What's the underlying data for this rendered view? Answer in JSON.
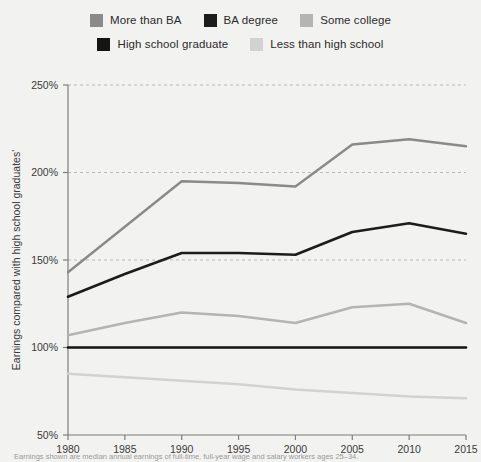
{
  "legend": {
    "rows": [
      [
        {
          "label": "More than BA",
          "color": "#8a8a8a",
          "name": "legend-item-more-than-ba"
        },
        {
          "label": "BA degree",
          "color": "#1c1c1c",
          "name": "legend-item-ba-degree"
        },
        {
          "label": "Some college",
          "color": "#b4b4b4",
          "name": "legend-item-some-college"
        }
      ],
      [
        {
          "label": "High school graduate",
          "color": "#141414",
          "name": "legend-item-high-school-graduate"
        },
        {
          "label": "Less than high school",
          "color": "#d2d2d2",
          "name": "legend-item-less-than-high-school"
        }
      ]
    ]
  },
  "footnote": {
    "text": "Earnings shown are median annual earnings of full-time, full-year wage and salary workers ages 25–34."
  },
  "chart_data": {
    "type": "line",
    "title": "",
    "xlabel": "",
    "ylabel": "Earnings compared with high school graduates'",
    "x": [
      1980,
      1985,
      1990,
      1995,
      2000,
      2005,
      2010,
      2015
    ],
    "xtick_labels": [
      "1980",
      "1985",
      "1990",
      "1995",
      "2000",
      "2005",
      "2010",
      "2015"
    ],
    "xlim": [
      1980,
      2015
    ],
    "ylim": [
      50,
      250
    ],
    "yticks": [
      50,
      100,
      150,
      200,
      250
    ],
    "ytick_labels": [
      "50%",
      "100%",
      "150%",
      "200%",
      "250%"
    ],
    "grid": "horizontal-dashed",
    "legend_position": "top",
    "series": [
      {
        "name": "More than BA",
        "color": "#8a8a8a",
        "width": 2.4,
        "values": [
          143,
          169,
          195,
          194,
          192,
          216,
          219,
          215
        ]
      },
      {
        "name": "BA degree",
        "color": "#1c1c1c",
        "width": 2.6,
        "values": [
          129,
          142,
          154,
          154,
          153,
          166,
          171,
          165
        ]
      },
      {
        "name": "Some college",
        "color": "#b4b4b4",
        "width": 2.6,
        "values": [
          107,
          114,
          120,
          118,
          114,
          123,
          125,
          114
        ]
      },
      {
        "name": "High school graduate",
        "color": "#141414",
        "width": 2.6,
        "values": [
          100,
          100,
          100,
          100,
          100,
          100,
          100,
          100
        ]
      },
      {
        "name": "Less than high school",
        "color": "#d2d2d2",
        "width": 2.6,
        "values": [
          85,
          83,
          81,
          79,
          76,
          74,
          72,
          71
        ]
      }
    ]
  }
}
